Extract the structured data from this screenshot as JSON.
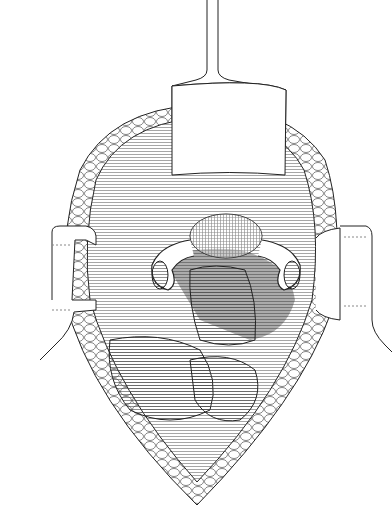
{
  "figure": {
    "type": "surgical line illustration",
    "caption_fragment": "",
    "colors": {
      "ink": "#1a1a1a",
      "background": "#ffffff",
      "hatch": "#555555"
    },
    "elements": [
      {
        "id": "top-retractor",
        "label": "Blade retractor (superior)"
      },
      {
        "id": "left-retractor",
        "label": "Lateral retractor (left)"
      },
      {
        "id": "right-retractor",
        "label": "Lateral retractor (right)"
      },
      {
        "id": "incision-wound",
        "label": "Incision wound edges"
      },
      {
        "id": "uterus",
        "label": "Uterus"
      },
      {
        "id": "left-adnexa",
        "label": "Left tube and ovary"
      },
      {
        "id": "right-adnexa",
        "label": "Right tube and ovary"
      },
      {
        "id": "bowel",
        "label": "Bowel loops"
      }
    ]
  }
}
